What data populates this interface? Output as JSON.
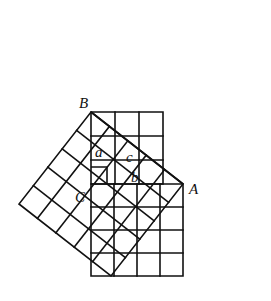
{
  "diagram": {
    "triangle": {
      "vertices": {
        "A": {
          "label": "A",
          "x": 183,
          "y": 184
        },
        "B": {
          "label": "B",
          "x": 91,
          "y": 112
        },
        "C": {
          "label": "C",
          "x": 91,
          "y": 184
        }
      },
      "sides": {
        "a": {
          "label": "a",
          "units": 3
        },
        "b": {
          "label": "b",
          "units": 4
        },
        "c": {
          "label": "c",
          "units": 5
        }
      },
      "right_angle_at": "C"
    },
    "squares": [
      {
        "name": "square-on-a",
        "grid": 3
      },
      {
        "name": "square-on-b",
        "grid": 4
      },
      {
        "name": "square-on-c",
        "grid": 5
      }
    ],
    "labels": {
      "A": "A",
      "B": "B",
      "C": "C",
      "a": "a",
      "b": "b",
      "c": "c"
    },
    "colors": {
      "stroke": "#111111",
      "background": "#ffffff"
    }
  }
}
